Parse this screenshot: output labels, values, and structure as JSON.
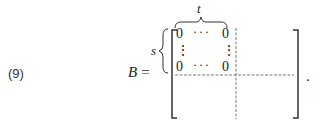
{
  "equation": {
    "number": "(9)",
    "lhs_symbol": "B",
    "equals": "=",
    "row_label": "s",
    "col_label": "t",
    "block": {
      "top_left": "0",
      "top_right": "0",
      "bottom_left": "0",
      "bottom_right": "0",
      "hdots": "···",
      "vdots": "⋮"
    },
    "terminator": "."
  }
}
